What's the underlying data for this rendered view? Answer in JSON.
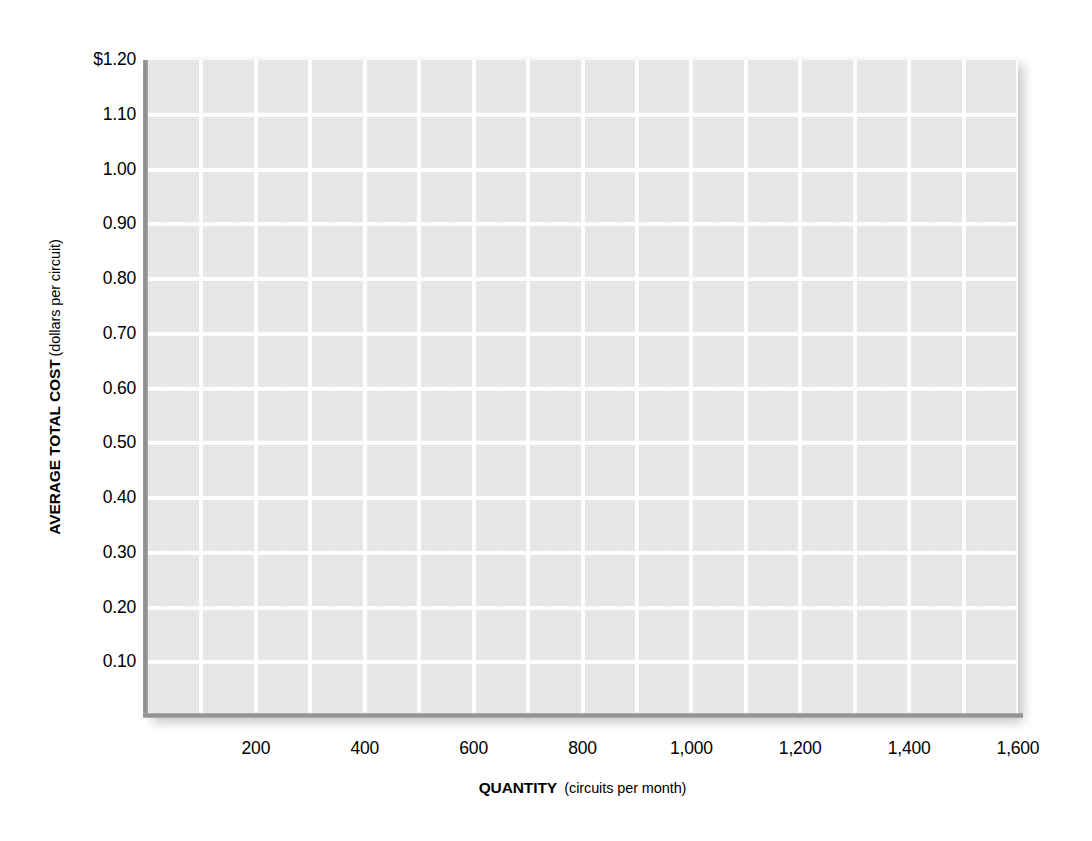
{
  "chart_data": {
    "type": "line",
    "title": "",
    "subtitle": "",
    "xlabel_bold": "QUANTITY",
    "xlabel_note": "(circuits per month)",
    "ylabel_bold": "AVERAGE TOTAL COST",
    "ylabel_note": "(dollars per circuit)",
    "xlim": [
      0,
      1600
    ],
    "ylim": [
      0,
      1.2
    ],
    "x_tick_labels": [
      "200",
      "400",
      "600",
      "800",
      "1,000",
      "1,200",
      "1,400",
      "1,600"
    ],
    "x_tick_values": [
      200,
      400,
      600,
      800,
      1000,
      1200,
      1400,
      1600
    ],
    "x_major_step": 200,
    "x_gridline_step": 100,
    "y_tick_labels": [
      "$1.20",
      "1.10",
      "1.00",
      "0.90",
      "0.80",
      "0.70",
      "0.60",
      "0.50",
      "0.40",
      "0.30",
      "0.20",
      "0.10"
    ],
    "y_tick_values": [
      1.2,
      1.1,
      1.0,
      0.9,
      0.8,
      0.7,
      0.6,
      0.5,
      0.4,
      0.3,
      0.2,
      0.1
    ],
    "y_gridline_step": 0.1,
    "grid": true,
    "grid_color": "#fdfdfd",
    "plot_background": "#e4e4e4",
    "axis_color": "#8d8d8d",
    "legend": [],
    "legend_position": "none",
    "annotations": [],
    "series": [],
    "values": [],
    "categories": [],
    "note": "Blank plotting grid: no data series are drawn."
  }
}
